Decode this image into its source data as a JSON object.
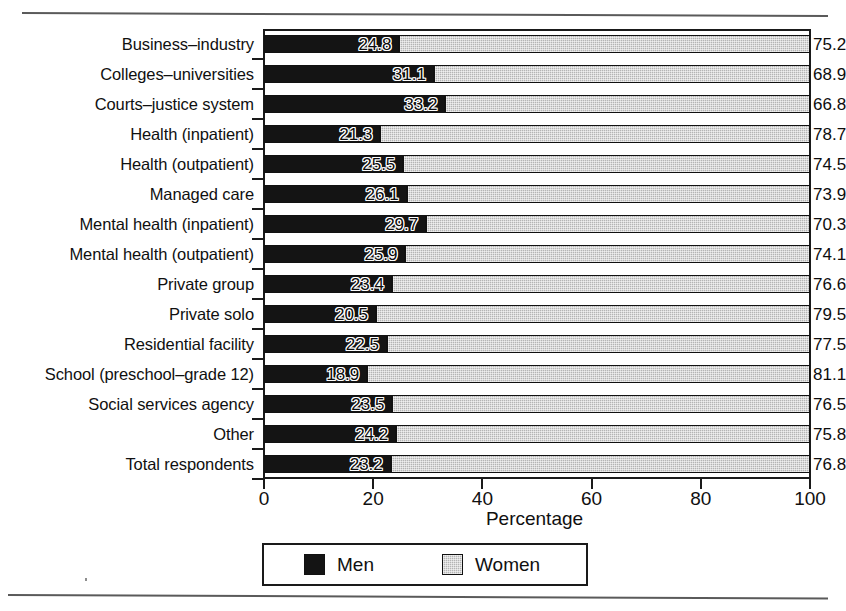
{
  "chart_data": {
    "type": "bar",
    "orientation": "horizontal",
    "stacked": true,
    "title": "",
    "xlabel": "Percentage",
    "ylabel": "",
    "xlim": [
      0,
      100
    ],
    "xticks": [
      0,
      20,
      40,
      60,
      80,
      100
    ],
    "xticklabels": [
      "0",
      "20",
      "40",
      "60",
      "80",
      "100"
    ],
    "grid": false,
    "legend_position": "bottom-center",
    "categories": [
      "Business–industry",
      "Colleges–universities",
      "Courts–justice system",
      "Health (inpatient)",
      "Health (outpatient)",
      "Managed care",
      "Mental health (inpatient)",
      "Mental health (outpatient)",
      "Private group",
      "Private solo",
      "Residential facility",
      "School (preschool–grade 12)",
      "Social services agency",
      "Other",
      "Total respondents"
    ],
    "series": [
      {
        "name": "Men",
        "color": "#141414",
        "values": [
          24.8,
          31.1,
          33.2,
          21.3,
          25.5,
          26.1,
          29.7,
          25.9,
          23.4,
          20.5,
          22.5,
          18.9,
          23.5,
          24.2,
          23.2
        ],
        "labels": [
          "24.8",
          "31.1",
          "33.2",
          "21.3",
          "25.5",
          "26.1",
          "29.7",
          "25.9",
          "23.4",
          "20.5",
          "22.5",
          "18.9",
          "23.5",
          "24.2",
          "23.2"
        ]
      },
      {
        "name": "Women",
        "color": "#b4b4b4",
        "values": [
          75.2,
          68.9,
          66.8,
          78.7,
          74.5,
          73.9,
          70.3,
          74.1,
          76.6,
          79.5,
          77.5,
          81.1,
          76.5,
          75.8,
          76.8
        ],
        "labels": [
          "75.2",
          "68.9",
          "66.8",
          "78.7",
          "74.5",
          "73.9",
          "70.3",
          "74.1",
          "76.6",
          "79.5",
          "77.5",
          "81.1",
          "76.5",
          "75.8",
          "76.8"
        ]
      }
    ]
  },
  "legend": {
    "items": [
      {
        "label": "Men",
        "swatch": "men-swatch"
      },
      {
        "label": "Women",
        "swatch": "women-swatch"
      }
    ]
  },
  "axis": {
    "x_title": "Percentage"
  }
}
